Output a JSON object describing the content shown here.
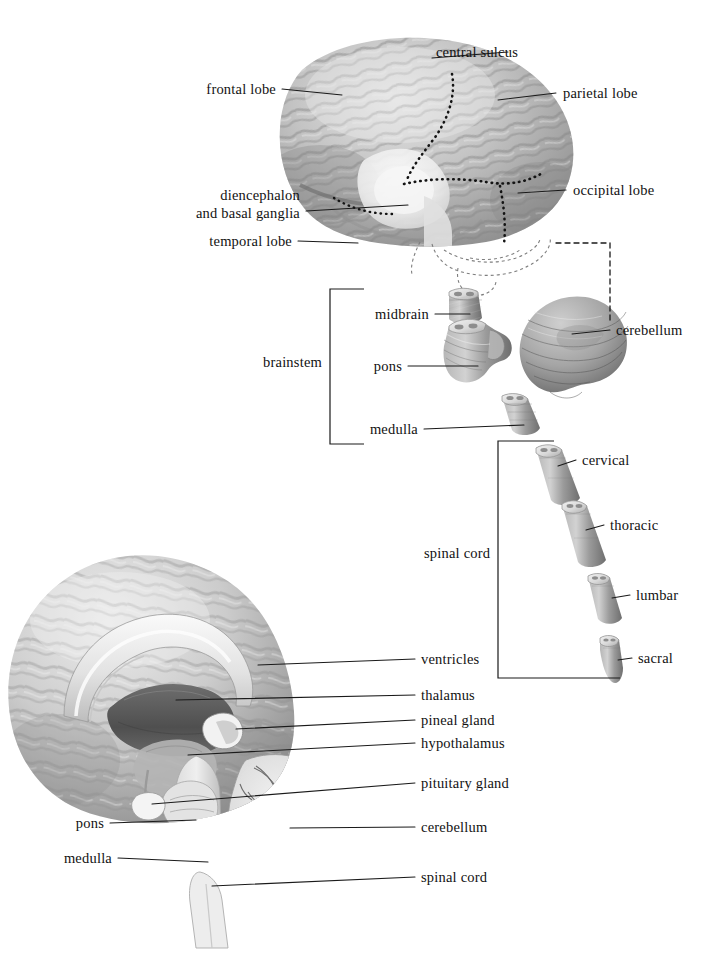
{
  "figure": {
    "background_color": "#ffffff",
    "label_color": "#121212",
    "leader_color": "#1a1a1a"
  },
  "palette": {
    "cortex_light": "#d2d2d2",
    "cortex_mid": "#a9a9a9",
    "cortex_dark": "#6f6f6f",
    "sulcus": "#5d5d5d",
    "highlight": "#f0f0f0",
    "thalamus_dark": "#5a5a5a",
    "stem_gray": "#9a9a9a",
    "white_matter": "#e8e8e8"
  },
  "lateral_view": {
    "name": "lateral-brain-view",
    "labels": [
      {
        "id": "central-sulcus",
        "text": "central sulcus",
        "side": "right"
      },
      {
        "id": "parietal-lobe",
        "text": "parietal lobe",
        "side": "right"
      },
      {
        "id": "occipital-lobe",
        "text": "occipital lobe",
        "side": "right"
      },
      {
        "id": "frontal-lobe",
        "text": "frontal lobe",
        "side": "left"
      },
      {
        "id": "diencephalon",
        "text": "diencephalon",
        "side": "left"
      },
      {
        "id": "basal-ganglia",
        "text": "and basal ganglia",
        "side": "left"
      },
      {
        "id": "temporal-lobe",
        "text": "temporal lobe",
        "side": "left"
      }
    ]
  },
  "brainstem_view": {
    "name": "brainstem-exploded-view",
    "bracket_label": "brainstem",
    "labels": [
      {
        "id": "midbrain",
        "text": "midbrain"
      },
      {
        "id": "pons",
        "text": "pons"
      },
      {
        "id": "medulla",
        "text": "medulla"
      },
      {
        "id": "cerebellum",
        "text": "cerebellum"
      }
    ]
  },
  "spinal_cord_view": {
    "name": "spinal-cord-segments",
    "bracket_label": "spinal cord",
    "segments": [
      {
        "id": "cervical",
        "text": "cervical"
      },
      {
        "id": "thoracic",
        "text": "thoracic"
      },
      {
        "id": "lumbar",
        "text": "lumbar"
      },
      {
        "id": "sacral",
        "text": "sacral"
      }
    ]
  },
  "midsagittal_view": {
    "name": "midsagittal-brain-view",
    "labels_right": [
      {
        "id": "ventricles",
        "text": "ventricles"
      },
      {
        "id": "thalamus",
        "text": "thalamus"
      },
      {
        "id": "pineal-gland",
        "text": "pineal gland"
      },
      {
        "id": "hypothalamus",
        "text": "hypothalamus"
      },
      {
        "id": "pituitary-gland",
        "text": "pituitary gland"
      },
      {
        "id": "cerebellum",
        "text": "cerebellum"
      },
      {
        "id": "spinal-cord",
        "text": "spinal cord"
      }
    ],
    "labels_left": [
      {
        "id": "pons",
        "text": "pons"
      },
      {
        "id": "medulla",
        "text": "medulla"
      }
    ]
  }
}
